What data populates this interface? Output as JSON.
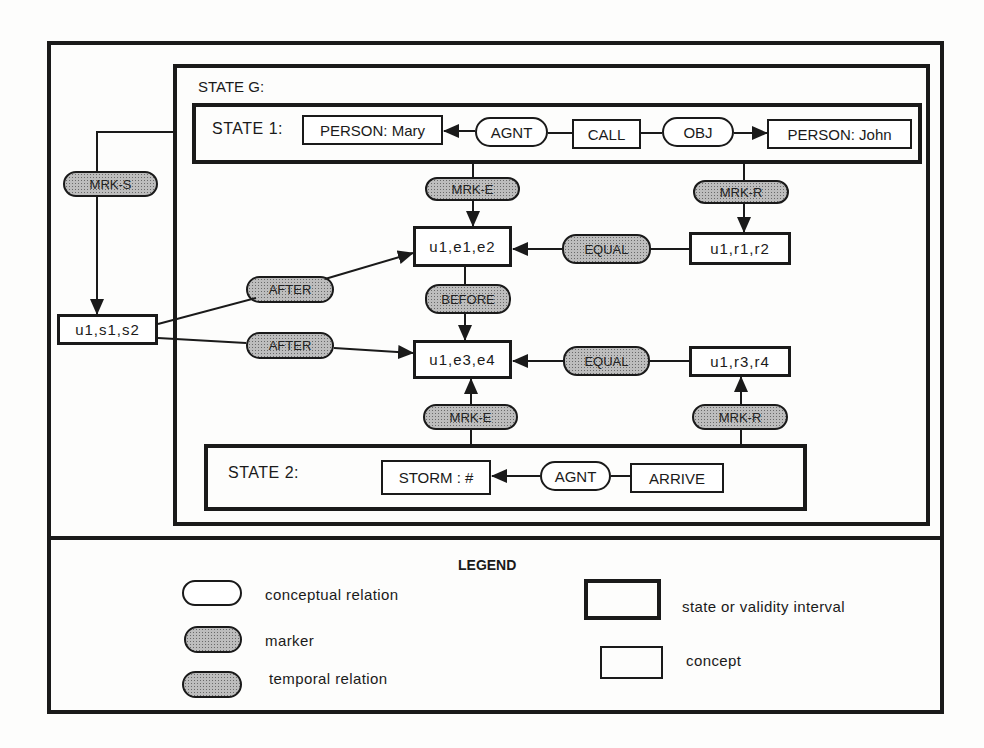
{
  "diagram": {
    "state_g": {
      "label": "STATE G:"
    },
    "state_1": {
      "label": "STATE 1:",
      "concepts": {
        "person_mary": "PERSON: Mary",
        "call": "CALL",
        "person_john": "PERSON: John"
      },
      "relations": {
        "agnt": "AGNT",
        "obj": "OBJ"
      }
    },
    "state_2": {
      "label": "STATE 2:",
      "concepts": {
        "storm": "STORM : #",
        "arrive": "ARRIVE"
      },
      "relations": {
        "agnt": "AGNT"
      }
    },
    "intervals": {
      "s": "u1,s1,s2",
      "e12": "u1,e1,e2",
      "e34": "u1,e3,e4",
      "r12": "u1,r1,r2",
      "r34": "u1,r3,r4"
    },
    "markers": {
      "mrk_s": "MRK-S",
      "mrk_e_top": "MRK-E",
      "mrk_r_top": "MRK-R",
      "mrk_e_bottom": "MRK-E",
      "mrk_r_bottom": "MRK-R"
    },
    "temporal": {
      "after_top": "AFTER",
      "after_bottom": "AFTER",
      "before": "BEFORE",
      "equal_top": "EQUAL",
      "equal_bottom": "EQUAL"
    },
    "edges": [
      {
        "from": "AGNT",
        "to": "PERSON: Mary"
      },
      {
        "from": "CALL",
        "to": "AGNT"
      },
      {
        "from": "CALL",
        "to": "OBJ"
      },
      {
        "from": "OBJ",
        "to": "PERSON: John"
      },
      {
        "from": "STATE 1",
        "to": "MRK-E",
        "then": "u1,e1,e2"
      },
      {
        "from": "STATE 1",
        "to": "MRK-R",
        "then": "u1,r1,r2"
      },
      {
        "from": "STATE G",
        "to": "MRK-S",
        "then": "u1,s1,s2"
      },
      {
        "from": "u1,s1,s2",
        "to": "AFTER",
        "then": "u1,e1,e2"
      },
      {
        "from": "u1,s1,s2",
        "to": "AFTER",
        "then": "u1,e3,e4"
      },
      {
        "from": "u1,e1,e2",
        "to": "BEFORE",
        "then": "u1,e3,e4"
      },
      {
        "from": "u1,r1,r2",
        "to": "EQUAL",
        "then": "u1,e1,e2"
      },
      {
        "from": "u1,r3,r4",
        "to": "EQUAL",
        "then": "u1,e3,e4"
      },
      {
        "from": "STATE 2",
        "to": "MRK-E",
        "then": "u1,e3,e4"
      },
      {
        "from": "STATE 2",
        "to": "MRK-R",
        "then": "u1,r3,r4"
      },
      {
        "from": "AGNT",
        "to": "STORM : #"
      },
      {
        "from": "ARRIVE",
        "to": "AGNT"
      }
    ]
  },
  "legend": {
    "title": "LEGEND",
    "items": [
      {
        "shape": "white-oval",
        "label": "conceptual relation"
      },
      {
        "shape": "shaded-oval",
        "label": "marker"
      },
      {
        "shape": "shaded-oval-dark",
        "label": "temporal relation"
      },
      {
        "shape": "thick-rectangle",
        "label": "state or validity interval"
      },
      {
        "shape": "thin-rectangle",
        "label": "concept"
      }
    ]
  },
  "colors": {
    "ink": "#1a1a1a",
    "paper": "#fdfdfc",
    "shade": "#bdbdbd"
  }
}
